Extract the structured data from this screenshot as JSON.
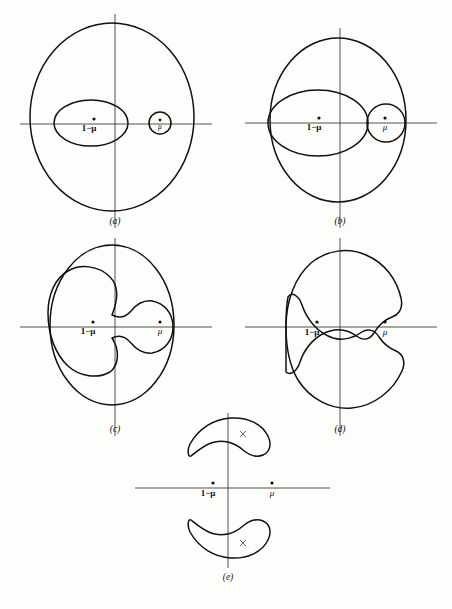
{
  "figure": {
    "type": "scientific-diagram",
    "background_color": "#fdfdfc",
    "curve_color": "#111111",
    "axis_color": "#3c3c3c"
  },
  "labels": {
    "primary": "1−μ",
    "secondary": "μ",
    "cross_marker": "×"
  },
  "panels": [
    {
      "id": "a",
      "label": "(a)",
      "caption_x": 115,
      "caption_y": 224,
      "origin": {
        "x": 115,
        "y": 124
      },
      "axis": {
        "x1": 20,
        "x2": 212,
        "y1": 14,
        "y2": 228
      },
      "primary_label_pos": {
        "x": 89,
        "y": 131
      },
      "primary_dot": {
        "x": 94,
        "y": 119
      },
      "secondary_label_pos": {
        "x": 160,
        "y": 129
      },
      "secondary_dot": {
        "x": 160,
        "y": 120
      },
      "curves": [
        {
          "name": "outer-oval",
          "type": "ellipse",
          "cx": 112,
          "cy": 117,
          "rx": 82,
          "ry": 94
        },
        {
          "name": "inner-ellipse-primary",
          "type": "ellipse",
          "cx": 91,
          "cy": 123,
          "rx": 37,
          "ry": 23
        },
        {
          "name": "inner-circle-secondary",
          "type": "ellipse",
          "cx": 160,
          "cy": 123,
          "rx": 11,
          "ry": 11
        }
      ]
    },
    {
      "id": "b",
      "label": "(b)",
      "caption_x": 340,
      "caption_y": 224,
      "origin": {
        "x": 340,
        "y": 123
      },
      "axis": {
        "x1": 245,
        "x2": 437,
        "y1": 28,
        "y2": 228
      },
      "primary_label_pos": {
        "x": 314,
        "y": 130
      },
      "primary_dot": {
        "x": 319,
        "y": 118
      },
      "secondary_label_pos": {
        "x": 385,
        "y": 130
      },
      "secondary_dot": {
        "x": 385,
        "y": 118
      },
      "curves": [
        {
          "name": "outer-oval",
          "type": "ellipse",
          "cx": 338,
          "cy": 120,
          "rx": 68,
          "ry": 82
        },
        {
          "name": "inner-ellipse-primary",
          "type": "ellipse",
          "cx": 318,
          "cy": 123,
          "rx": 50,
          "ry": 33
        },
        {
          "name": "inner-circle-secondary",
          "type": "ellipse",
          "cx": 386,
          "cy": 123,
          "rx": 19,
          "ry": 19
        }
      ]
    },
    {
      "id": "c",
      "label": "(c)",
      "caption_x": 115,
      "caption_y": 432,
      "origin": {
        "x": 115,
        "y": 327
      },
      "axis": {
        "x1": 20,
        "x2": 212,
        "y1": 238,
        "y2": 436
      },
      "primary_label_pos": {
        "x": 88,
        "y": 334
      },
      "primary_dot": {
        "x": 93,
        "y": 322
      },
      "secondary_label_pos": {
        "x": 160,
        "y": 334
      },
      "secondary_dot": {
        "x": 160,
        "y": 322
      },
      "curves": [
        {
          "name": "outer-oval",
          "type": "ellipse",
          "cx": 112,
          "cy": 325,
          "rx": 62,
          "ry": 80
        },
        {
          "name": "peanut-contour",
          "type": "path"
        }
      ]
    },
    {
      "id": "d",
      "label": "(d)",
      "caption_x": 340,
      "caption_y": 432,
      "origin": {
        "x": 340,
        "y": 327
      },
      "axis": {
        "x1": 245,
        "x2": 437,
        "y1": 238,
        "y2": 436
      },
      "primary_label_pos": {
        "x": 312,
        "y": 335
      },
      "primary_dot": {
        "x": 317,
        "y": 322
      },
      "secondary_label_pos": {
        "x": 385,
        "y": 335
      },
      "secondary_dot": {
        "x": 385,
        "y": 322
      },
      "curves": [
        {
          "name": "outer-crescent",
          "type": "path"
        },
        {
          "name": "inner-crescent",
          "type": "path"
        }
      ]
    },
    {
      "id": "e",
      "label": "(e)",
      "caption_x": 228,
      "caption_y": 580,
      "origin": {
        "x": 228,
        "y": 488
      },
      "axis": {
        "x1": 135,
        "x2": 330,
        "y1": 413,
        "y2": 568
      },
      "primary_label_pos": {
        "x": 208,
        "y": 496
      },
      "primary_dot": {
        "x": 213,
        "y": 483
      },
      "secondary_label_pos": {
        "x": 272,
        "y": 496
      },
      "secondary_dot": {
        "x": 272,
        "y": 483
      },
      "cross_markers": [
        {
          "name": "L4",
          "x": 243,
          "y": 434
        },
        {
          "name": "L5",
          "x": 243,
          "y": 543
        }
      ],
      "curves": [
        {
          "name": "upper-banana",
          "type": "path"
        },
        {
          "name": "lower-banana",
          "type": "path"
        }
      ]
    }
  ]
}
